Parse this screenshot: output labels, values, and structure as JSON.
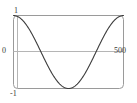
{
  "plot": {
    "frame": {
      "border_color": "#9a9a9a",
      "axis_color": "#b0b0b0",
      "curve_color": "#3c3c3c",
      "background": "#ffffff",
      "corner_radius": 4
    },
    "labels": {
      "y_max": "1",
      "y_zero": "0",
      "y_min": "-1",
      "x_max": "500"
    }
  },
  "chart_data": {
    "type": "line",
    "title": "",
    "subtitle": "",
    "xlabel": "",
    "ylabel": "",
    "xlim": [
      0,
      500
    ],
    "ylim": [
      -1,
      1
    ],
    "grid": false,
    "legend": null,
    "axis_lines": {
      "horizontal_zero": 0,
      "vertical_zero": 0
    },
    "xtick_labels": [
      "500"
    ],
    "ytick_labels": [
      "1",
      "0",
      "-1"
    ],
    "series": [
      {
        "name": "cos",
        "description": "Cosine wave, one full period across x = 0 to 500, amplitude 1",
        "x": [
          0,
          20,
          40,
          60,
          80,
          100,
          120,
          140,
          160,
          180,
          200,
          220,
          240,
          250,
          260,
          280,
          300,
          320,
          340,
          360,
          380,
          400,
          420,
          440,
          460,
          480,
          500
        ],
        "values": [
          1.0,
          0.969,
          0.876,
          0.729,
          0.536,
          0.309,
          0.063,
          -0.187,
          -0.426,
          -0.637,
          -0.809,
          -0.93,
          -0.995,
          -1.0,
          -0.995,
          -0.93,
          -0.809,
          -0.637,
          -0.426,
          -0.187,
          0.063,
          0.309,
          0.536,
          0.729,
          0.876,
          0.969,
          1.0
        ]
      }
    ]
  }
}
